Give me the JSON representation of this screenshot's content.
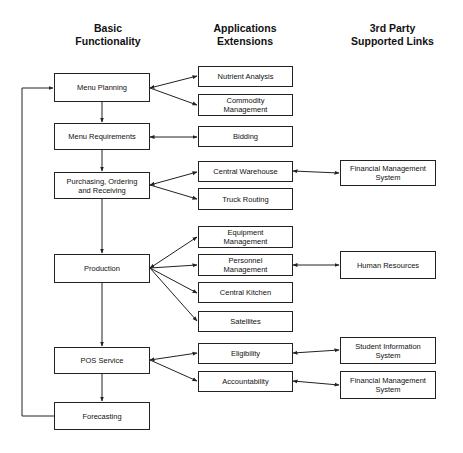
{
  "headers": {
    "basic": "Basic\nFunctionality",
    "apps": "Applications\nExtensions",
    "third": "3rd Party\nSupported Links"
  },
  "basic": [
    {
      "label": "Menu Planning"
    },
    {
      "label": "Menu Requirements"
    },
    {
      "label": "Purchasing, Ordering\nand Receiving"
    },
    {
      "label": "Production"
    },
    {
      "label": "POS Service"
    },
    {
      "label": "Forecasting"
    }
  ],
  "apps": [
    {
      "label": "Nutrient Analysis"
    },
    {
      "label": "Commodity\nManagement"
    },
    {
      "label": "Bidding"
    },
    {
      "label": "Central Warehouse"
    },
    {
      "label": "Truck Routing"
    },
    {
      "label": "Equipment\nManagement"
    },
    {
      "label": "Personnel\nManagement"
    },
    {
      "label": "Central Kitchen"
    },
    {
      "label": "Satellites"
    },
    {
      "label": "Eligibility"
    },
    {
      "label": "Accountability"
    }
  ],
  "third": [
    {
      "label": "Financial Management\nSystem"
    },
    {
      "label": "Human Resources"
    },
    {
      "label": "Student Information\nSystem"
    },
    {
      "label": "Financial Management\nSystem"
    }
  ],
  "colors": {
    "line": "#222222",
    "box_border": "#222222",
    "background": "#ffffff"
  }
}
